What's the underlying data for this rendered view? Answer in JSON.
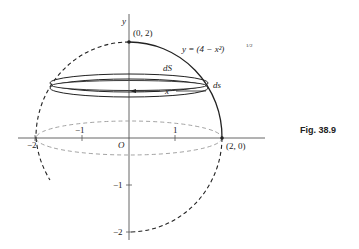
{
  "figure": {
    "caption": "Fig. 38.9",
    "curve_label": "y = (4 − x²)",
    "curve_exponent": "1/2",
    "y_axis_label": "y",
    "origin_label": "O",
    "top_point_label": "(0, 2)",
    "right_point_label": "(2, 0)",
    "ring_label_dS": "dS",
    "ring_label_ds": "ds",
    "radius_label": "x",
    "x_ticks": [
      {
        "value": -2,
        "label": "−2"
      },
      {
        "value": -1,
        "label": "−1"
      },
      {
        "value": 1,
        "label": "1"
      }
    ],
    "y_ticks": [
      {
        "value": -1,
        "label": "−1"
      },
      {
        "value": -2,
        "label": "−2"
      }
    ],
    "colors": {
      "ink": "#222222",
      "axis": "#555555",
      "dashed_base": "#999999"
    }
  }
}
